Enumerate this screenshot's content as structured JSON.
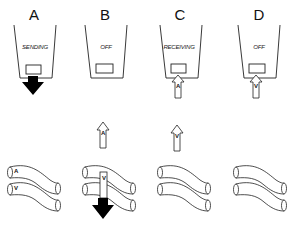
{
  "diagram": {
    "panels": [
      {
        "id": "A",
        "label": "A",
        "state": "SENDING",
        "tube_labels": [
          "A",
          "V"
        ]
      },
      {
        "id": "B",
        "label": "B",
        "state": "OFF",
        "floating_arrow_letter": "A",
        "tube_arrow_letter": "V"
      },
      {
        "id": "C",
        "label": "C",
        "state": "RECEIVING",
        "cup_arrow_letter": "A",
        "floating_arrow_letter": "V"
      },
      {
        "id": "D",
        "label": "D",
        "state": "OFF",
        "cup_arrow_letter": "V"
      }
    ],
    "colors": {
      "line": "#222222",
      "fill_arrow": "#000000",
      "background": "#ffffff"
    }
  }
}
